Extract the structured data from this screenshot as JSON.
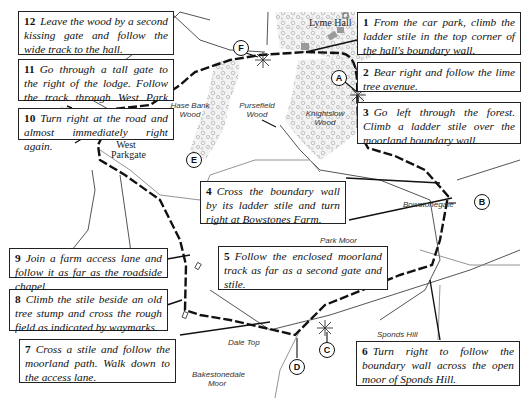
{
  "map": {
    "title": "Lyme Park walk route map",
    "places": {
      "lyme_hall": "Lyme Hall",
      "hase_bank_wood": "Hase Bank Wood",
      "pursefield_wood": "Pursefield Wood",
      "knightslow_wood": "Knightslow Wood",
      "west_parkgate": "West Parkgate",
      "bowstonegate": "Bowstonegate",
      "park_moor": "Park Moor",
      "sponds_hill": "Sponds Hill",
      "dale_top": "Dale Top",
      "bakestonedale_moor": "Bakestonedale Moor"
    },
    "markers": [
      "A",
      "B",
      "C",
      "D",
      "E",
      "F"
    ],
    "colors": {
      "route": "#111111",
      "woodland": "#bfbfbf",
      "building": "#9a9a9a",
      "road": "#777777"
    }
  },
  "steps": [
    {
      "num": "1",
      "text": "From the car park, climb the ladder stile in the top corner of the hall's boundary wall."
    },
    {
      "num": "2",
      "text": "Bear right and follow the lime tree avenue."
    },
    {
      "num": "3",
      "text": "Go left through the forest. Climb a ladder stile over the moorland boundary wall."
    },
    {
      "num": "4",
      "text": "Cross the boundary wall by its ladder stile and turn right at Bowstones Farm."
    },
    {
      "num": "5",
      "text": "Follow the enclosed moorland track as far as a second gate and stile."
    },
    {
      "num": "6",
      "text": "Turn right to follow the boundary wall across the open moor of Sponds Hill."
    },
    {
      "num": "7",
      "text": "Cross a stile and follow the moorland path. Walk down to the access lane."
    },
    {
      "num": "8",
      "text": "Climb the stile beside an old tree stump and cross the rough field as indicated by waymarks."
    },
    {
      "num": "9",
      "text": "Join a farm access lane and follow it as far as the roadside chapel."
    },
    {
      "num": "10",
      "text": "Turn right at the road and almost immediately right again."
    },
    {
      "num": "11",
      "text": "Go through a tall gate to the right of the lodge. Follow the track through West Park Woods."
    },
    {
      "num": "12",
      "text": "Leave the wood by a second kissing gate and follow the wide track to the hall."
    }
  ]
}
